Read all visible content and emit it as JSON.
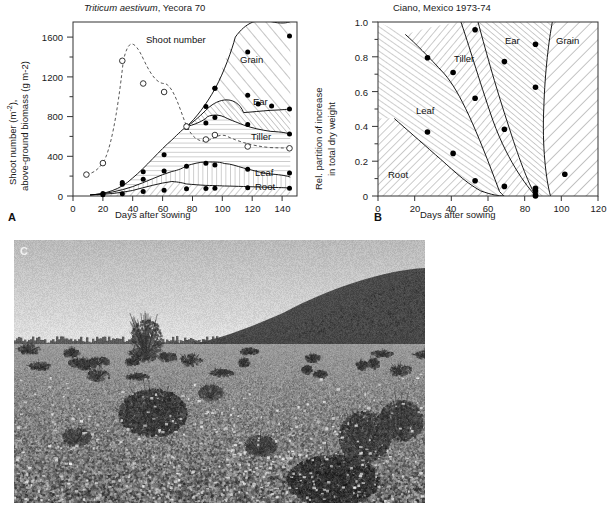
{
  "figure": {
    "panel_a_letter": "A",
    "panel_b_letter": "B",
    "panel_c_letter": "C",
    "caption_text": ""
  },
  "chart_data": [
    {
      "id": "panel_a",
      "type": "area",
      "title": "Triticum aestivum, Yecora 70",
      "title_species": "Triticum aestivum",
      "title_rest": ", Yecora 70",
      "xlabel": "Days after sowing",
      "ylabel_line1": "Shoot number (m-2),",
      "ylabel_line2": "above-ground biomass (g m-2)",
      "xlim": [
        0,
        150
      ],
      "ylim": [
        0,
        1750
      ],
      "xticks": [
        0,
        20,
        40,
        60,
        80,
        100,
        120,
        140
      ],
      "yticks": [
        0,
        400,
        800,
        1200,
        1600
      ],
      "yticks_minor": [
        200,
        600,
        1000,
        1400
      ],
      "grid": false,
      "legend_position": "inline-annotations",
      "annotations": [
        {
          "label": "Shoot number",
          "x": 58,
          "y": 1310
        },
        {
          "label": "Grain",
          "x": 123,
          "y": 1180
        },
        {
          "label": "Ear",
          "x": 130,
          "y": 820
        },
        {
          "label": "Tiller",
          "x": 127,
          "y": 565
        },
        {
          "label": "Leaf",
          "x": 130,
          "y": 185
        },
        {
          "label": "Root",
          "x": 130,
          "y": 88
        }
      ],
      "series": [
        {
          "name": "Shoot number",
          "marker": "open-circle",
          "line": "dashed",
          "unit": "m-2",
          "points": [
            {
              "x": 9,
              "y": 215
            },
            {
              "x": 20,
              "y": 330
            },
            {
              "x": 33,
              "y": 1360
            },
            {
              "x": 47,
              "y": 1120
            },
            {
              "x": 61,
              "y": 1035
            },
            {
              "x": 76,
              "y": 690
            },
            {
              "x": 89,
              "y": 560
            },
            {
              "x": 95,
              "y": 605
            },
            {
              "x": 117,
              "y": 490
            },
            {
              "x": 145,
              "y": 470
            }
          ]
        },
        {
          "name": "Root",
          "marker": "filled-circle",
          "line": "solid",
          "unit": "g m-2",
          "points": [
            {
              "x": 20,
              "y": 12
            },
            {
              "x": 33,
              "y": 22
            },
            {
              "x": 47,
              "y": 45
            },
            {
              "x": 61,
              "y": 58
            },
            {
              "x": 76,
              "y": 72
            },
            {
              "x": 89,
              "y": 75
            },
            {
              "x": 95,
              "y": 78
            },
            {
              "x": 117,
              "y": 82
            },
            {
              "x": 145,
              "y": 78
            }
          ]
        },
        {
          "name": "Leaf",
          "marker": "filled-circle",
          "line": "solid",
          "unit": "g m-2",
          "points": [
            {
              "x": 20,
              "y": 25
            },
            {
              "x": 33,
              "y": 118
            },
            {
              "x": 47,
              "y": 168
            },
            {
              "x": 61,
              "y": 252
            },
            {
              "x": 76,
              "y": 300
            },
            {
              "x": 89,
              "y": 330
            },
            {
              "x": 95,
              "y": 312
            },
            {
              "x": 117,
              "y": 270
            },
            {
              "x": 145,
              "y": 232
            }
          ]
        },
        {
          "name": "Tiller",
          "marker": "filled-circle",
          "line": "solid",
          "unit": "g m-2",
          "points": [
            {
              "x": 33,
              "y": 135
            },
            {
              "x": 47,
              "y": 245
            },
            {
              "x": 61,
              "y": 415
            },
            {
              "x": 76,
              "y": 690
            },
            {
              "x": 89,
              "y": 735
            },
            {
              "x": 95,
              "y": 790
            },
            {
              "x": 117,
              "y": 720
            },
            {
              "x": 145,
              "y": 625
            }
          ]
        },
        {
          "name": "Ear",
          "marker": "filled-circle",
          "line": "solid",
          "unit": "g m-2",
          "points": [
            {
              "x": 76,
              "y": 705
            },
            {
              "x": 89,
              "y": 900
            },
            {
              "x": 95,
              "y": 1085
            },
            {
              "x": 117,
              "y": 1015
            },
            {
              "x": 124,
              "y": 925
            },
            {
              "x": 133,
              "y": 905
            },
            {
              "x": 145,
              "y": 875
            }
          ]
        },
        {
          "name": "Grain",
          "marker": "filled-circle",
          "line": "solid",
          "unit": "g m-2",
          "points": [
            {
              "x": 95,
              "y": 1085
            },
            {
              "x": 117,
              "y": 1450
            },
            {
              "x": 145,
              "y": 1610
            }
          ]
        }
      ]
    },
    {
      "id": "panel_b",
      "type": "area",
      "title": "Ciano, Mexico 1973-74",
      "xlabel": "Days after sowing",
      "ylabel_line1": "Rel. partition of increase",
      "ylabel_line2": "in total dry weight",
      "xlim": [
        0,
        120
      ],
      "ylim": [
        0,
        1.0
      ],
      "xticks": [
        0,
        20,
        40,
        60,
        80,
        100,
        120
      ],
      "yticks": [
        0,
        0.2,
        0.4,
        0.6,
        0.8,
        1.0
      ],
      "ytick_labels": [
        "0",
        "0.2",
        "0.4",
        "0.6",
        "0.8",
        "1.0"
      ],
      "grid": false,
      "legend_position": "inline-annotations",
      "annotations": [
        {
          "label": "Root",
          "x": 17,
          "y": 0.115
        },
        {
          "label": "Leaf",
          "x": 33,
          "y": 0.535
        },
        {
          "label": "Tiller",
          "x": 57,
          "y": 0.795
        },
        {
          "label": "Ear",
          "x": 80,
          "y": 0.905
        },
        {
          "label": "Grain",
          "x": 103,
          "y": 0.905
        }
      ],
      "series": [
        {
          "name": "Root boundary",
          "marker": "filled-circle",
          "line": "solid",
          "points": [
            {
              "x": 27,
              "y": 0.368
            },
            {
              "x": 41,
              "y": 0.245
            },
            {
              "x": 53,
              "y": 0.088
            },
            {
              "x": 69,
              "y": 0.055
            },
            {
              "x": 86,
              "y": 0.045
            },
            {
              "x": 86,
              "y": 0.005
            }
          ]
        },
        {
          "name": "Leaf boundary",
          "marker": "filled-circle",
          "line": "solid",
          "points": [
            {
              "x": 27,
              "y": 0.795
            },
            {
              "x": 41,
              "y": 0.71
            },
            {
              "x": 53,
              "y": 0.562
            },
            {
              "x": 69,
              "y": 0.385
            },
            {
              "x": 86,
              "y": 0.028
            },
            {
              "x": 86,
              "y": 0.0
            }
          ]
        },
        {
          "name": "Tiller boundary",
          "marker": "filled-circle",
          "line": "solid",
          "points": [
            {
              "x": 53,
              "y": 0.955
            },
            {
              "x": 69,
              "y": 0.772
            },
            {
              "x": 86,
              "y": 0.625
            },
            {
              "x": 102,
              "y": 0.125
            }
          ]
        },
        {
          "name": "Ear boundary",
          "marker": "filled-circle",
          "line": "solid",
          "points": [
            {
              "x": 86,
              "y": 0.872
            },
            {
              "x": 102,
              "y": 0.125
            }
          ]
        }
      ]
    }
  ]
}
